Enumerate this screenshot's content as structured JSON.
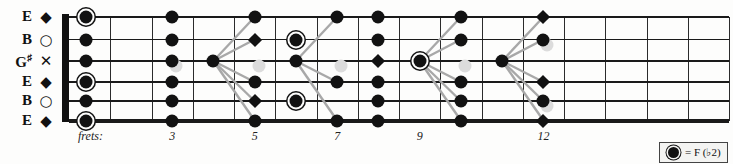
{
  "strings": [
    {
      "name": "E",
      "accidental": "",
      "marker": "◆",
      "marker_name": "diamond-marker"
    },
    {
      "name": "B",
      "accidental": "",
      "marker": "○",
      "marker_name": "circle-marker"
    },
    {
      "name": "G",
      "accidental": "♯",
      "marker": "✕",
      "marker_name": "x-marker"
    },
    {
      "name": "E",
      "accidental": "",
      "marker": "◆",
      "marker_name": "diamond-marker"
    },
    {
      "name": "B",
      "accidental": "",
      "marker": "○",
      "marker_name": "circle-marker"
    },
    {
      "name": "E",
      "accidental": "",
      "marker": "◆",
      "marker_name": "diamond-marker"
    }
  ],
  "frets": {
    "label": "frets:",
    "numbers": [
      "3",
      "5",
      "7",
      "9",
      "12"
    ]
  },
  "legend": {
    "symbol": "◉",
    "text": "= F (♭2)"
  },
  "colors": {
    "ink": "#121212",
    "link": "#a8a8a8",
    "ghost": "#dcdcdc",
    "paper": "#fdfdfc"
  },
  "chart_data": {
    "type": "fretboard",
    "tuning": [
      "E",
      "B",
      "G#",
      "E",
      "B",
      "E"
    ],
    "fret_range": [
      0,
      16
    ],
    "notes": [
      {
        "string": 1,
        "fret": 0,
        "shape": "dot-ring"
      },
      {
        "string": 2,
        "fret": 0,
        "shape": "dot"
      },
      {
        "string": 3,
        "fret": 0,
        "shape": "dot"
      },
      {
        "string": 4,
        "fret": 0,
        "shape": "dot-ring"
      },
      {
        "string": 5,
        "fret": 0,
        "shape": "dot"
      },
      {
        "string": 6,
        "fret": 0,
        "shape": "dot-ring"
      },
      {
        "string": 1,
        "fret": 3,
        "shape": "dot"
      },
      {
        "string": 2,
        "fret": 3,
        "shape": "dot"
      },
      {
        "string": 3,
        "fret": 3,
        "shape": "dot"
      },
      {
        "string": 4,
        "fret": 3,
        "shape": "dot"
      },
      {
        "string": 5,
        "fret": 3,
        "shape": "dot"
      },
      {
        "string": 6,
        "fret": 3,
        "shape": "dot"
      },
      {
        "string": 3,
        "fret": 4,
        "shape": "dot"
      },
      {
        "string": 1,
        "fret": 5,
        "shape": "dot"
      },
      {
        "string": 2,
        "fret": 5,
        "shape": "diamond"
      },
      {
        "string": 4,
        "fret": 5,
        "shape": "dot"
      },
      {
        "string": 5,
        "fret": 5,
        "shape": "diamond"
      },
      {
        "string": 6,
        "fret": 5,
        "shape": "dot"
      },
      {
        "string": 2,
        "fret": 6,
        "shape": "dot-ring"
      },
      {
        "string": 3,
        "fret": 6,
        "shape": "dot"
      },
      {
        "string": 5,
        "fret": 6,
        "shape": "dot-ring"
      },
      {
        "string": 1,
        "fret": 7,
        "shape": "dot"
      },
      {
        "string": 4,
        "fret": 7,
        "shape": "dot"
      },
      {
        "string": 6,
        "fret": 7,
        "shape": "dot"
      },
      {
        "string": 1,
        "fret": 8,
        "shape": "dot"
      },
      {
        "string": 2,
        "fret": 8,
        "shape": "dot"
      },
      {
        "string": 3,
        "fret": 8,
        "shape": "diamond"
      },
      {
        "string": 4,
        "fret": 8,
        "shape": "dot"
      },
      {
        "string": 5,
        "fret": 8,
        "shape": "dot"
      },
      {
        "string": 6,
        "fret": 8,
        "shape": "dot"
      },
      {
        "string": 3,
        "fret": 9,
        "shape": "dot-ring"
      },
      {
        "string": 1,
        "fret": 10,
        "shape": "dot"
      },
      {
        "string": 2,
        "fret": 10,
        "shape": "dot"
      },
      {
        "string": 4,
        "fret": 10,
        "shape": "dot"
      },
      {
        "string": 5,
        "fret": 10,
        "shape": "dot"
      },
      {
        "string": 6,
        "fret": 10,
        "shape": "dot"
      },
      {
        "string": 3,
        "fret": 11,
        "shape": "dot"
      },
      {
        "string": 1,
        "fret": 12,
        "shape": "diamond"
      },
      {
        "string": 2,
        "fret": 12,
        "shape": "dot"
      },
      {
        "string": 4,
        "fret": 12,
        "shape": "diamond"
      },
      {
        "string": 5,
        "fret": 12,
        "shape": "dot"
      },
      {
        "string": 6,
        "fret": 12,
        "shape": "diamond"
      }
    ],
    "ghost_notes": [
      {
        "string": 3,
        "fret": 3
      },
      {
        "string": 3,
        "fret": 5
      },
      {
        "string": 3,
        "fret": 7
      },
      {
        "string": 3,
        "fret": 10
      },
      {
        "string": 2,
        "fret": 12
      },
      {
        "string": 5,
        "fret": 12
      }
    ],
    "links": [
      {
        "from": {
          "string": 3,
          "fret": 4
        },
        "to": {
          "string": 1,
          "fret": 5
        }
      },
      {
        "from": {
          "string": 3,
          "fret": 4
        },
        "to": {
          "string": 2,
          "fret": 5
        }
      },
      {
        "from": {
          "string": 3,
          "fret": 4
        },
        "to": {
          "string": 4,
          "fret": 5
        }
      },
      {
        "from": {
          "string": 3,
          "fret": 4
        },
        "to": {
          "string": 5,
          "fret": 5
        }
      },
      {
        "from": {
          "string": 3,
          "fret": 4
        },
        "to": {
          "string": 6,
          "fret": 5
        }
      },
      {
        "from": {
          "string": 3,
          "fret": 6
        },
        "to": {
          "string": 1,
          "fret": 7
        }
      },
      {
        "from": {
          "string": 3,
          "fret": 6
        },
        "to": {
          "string": 4,
          "fret": 7
        }
      },
      {
        "from": {
          "string": 3,
          "fret": 6
        },
        "to": {
          "string": 6,
          "fret": 7
        }
      },
      {
        "from": {
          "string": 3,
          "fret": 9
        },
        "to": {
          "string": 1,
          "fret": 10
        }
      },
      {
        "from": {
          "string": 3,
          "fret": 9
        },
        "to": {
          "string": 2,
          "fret": 10
        }
      },
      {
        "from": {
          "string": 3,
          "fret": 9
        },
        "to": {
          "string": 4,
          "fret": 10
        }
      },
      {
        "from": {
          "string": 3,
          "fret": 9
        },
        "to": {
          "string": 5,
          "fret": 10
        }
      },
      {
        "from": {
          "string": 3,
          "fret": 9
        },
        "to": {
          "string": 6,
          "fret": 10
        }
      },
      {
        "from": {
          "string": 3,
          "fret": 11
        },
        "to": {
          "string": 1,
          "fret": 12
        }
      },
      {
        "from": {
          "string": 3,
          "fret": 11
        },
        "to": {
          "string": 2,
          "fret": 12
        }
      },
      {
        "from": {
          "string": 3,
          "fret": 11
        },
        "to": {
          "string": 4,
          "fret": 12
        }
      },
      {
        "from": {
          "string": 3,
          "fret": 11
        },
        "to": {
          "string": 5,
          "fret": 12
        }
      },
      {
        "from": {
          "string": 3,
          "fret": 11
        },
        "to": {
          "string": 6,
          "fret": 12
        }
      }
    ]
  }
}
